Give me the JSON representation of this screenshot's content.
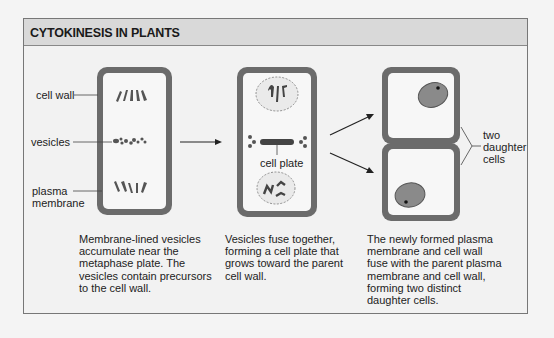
{
  "title": "CYTOKINESIS IN PLANTS",
  "labels": {
    "cell_wall": "cell wall",
    "vesicles": "vesicles",
    "plasma_membrane_line1": "plasma",
    "plasma_membrane_line2": "membrane",
    "cell_plate": "cell plate",
    "two_daughter_cells_line1": "two",
    "two_daughter_cells_line2": "daughter",
    "two_daughter_cells_line3": "cells"
  },
  "captions": {
    "step1": [
      "Membrane-lined vesicles",
      "accumulate near the",
      "metaphase plate. The",
      "vesicles contain precursors",
      "to the cell wall."
    ],
    "step2": [
      "Vesicles fuse together,",
      "forming a cell plate that",
      "grows toward the parent",
      "cell wall."
    ],
    "step3": [
      "The newly formed plasma",
      "membrane and cell wall",
      "fuse with the parent plasma",
      "membrane and cell wall,",
      "forming two distinct",
      "daughter cells."
    ]
  },
  "colors": {
    "cell_wall": "#6b6b6b",
    "cytoplasm": "#f7f7f7",
    "chromosome": "#555555",
    "header_bg": "#d9d9d9",
    "frame_bg": "#f2f2f2"
  }
}
